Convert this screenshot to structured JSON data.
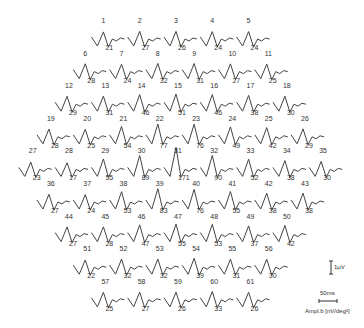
{
  "chart_data": {
    "type": "waveform-array",
    "title": "",
    "layout": "hexagonal",
    "rows": [
      {
        "hexagons": [
          {
            "id": "1",
            "amp": "21"
          },
          {
            "id": "2",
            "amp": "27"
          },
          {
            "id": "3",
            "amp": "26"
          },
          {
            "id": "4",
            "amp": "24"
          },
          {
            "id": "5",
            "amp": "24"
          }
        ]
      },
      {
        "hexagons": [
          {
            "id": "6",
            "amp": "28"
          },
          {
            "id": "7",
            "amp": "24"
          },
          {
            "id": "8",
            "amp": "32"
          },
          {
            "id": "9",
            "amp": "31"
          },
          {
            "id": "10",
            "amp": "27"
          },
          {
            "id": "11",
            "amp": "25"
          }
        ]
      },
      {
        "hexagons": [
          {
            "id": "12",
            "amp": "29"
          },
          {
            "id": "13",
            "amp": "31"
          },
          {
            "id": "14",
            "amp": "46"
          },
          {
            "id": "15",
            "amp": "51"
          },
          {
            "id": "16",
            "amp": "46"
          },
          {
            "id": "17",
            "amp": "38"
          },
          {
            "id": "18",
            "amp": "30"
          }
        ]
      },
      {
        "hexagons": [
          {
            "id": "19",
            "amp": "28"
          },
          {
            "id": "20",
            "amp": "25"
          },
          {
            "id": "21",
            "amp": "54"
          },
          {
            "id": "22",
            "amp": "77"
          },
          {
            "id": "23",
            "amp": "76"
          },
          {
            "id": "24",
            "amp": "49"
          },
          {
            "id": "25",
            "amp": "42"
          },
          {
            "id": "26",
            "amp": "29"
          }
        ]
      },
      {
        "hexagons": [
          {
            "id": "27",
            "amp": "23"
          },
          {
            "id": "28",
            "amp": "17"
          },
          {
            "id": "29",
            "amp": "55"
          },
          {
            "id": "30",
            "amp": "89"
          },
          {
            "id": "31",
            "amp": "171"
          },
          {
            "id": "32",
            "amp": "90"
          },
          {
            "id": "33",
            "amp": "52"
          },
          {
            "id": "34",
            "amp": "38"
          },
          {
            "id": "35",
            "amp": "30"
          }
        ]
      },
      {
        "hexagons": [
          {
            "id": "36",
            "amp": "27"
          },
          {
            "id": "37",
            "amp": "24"
          },
          {
            "id": "38",
            "amp": "53"
          },
          {
            "id": "39",
            "amp": "83"
          },
          {
            "id": "40",
            "amp": "76"
          },
          {
            "id": "41",
            "amp": "55"
          },
          {
            "id": "42",
            "amp": "38"
          },
          {
            "id": "43",
            "amp": "38"
          }
        ]
      },
      {
        "hexagons": [
          {
            "id": "44",
            "amp": "27"
          },
          {
            "id": "45",
            "amp": "28"
          },
          {
            "id": "46",
            "amp": "47"
          },
          {
            "id": "47",
            "amp": "55"
          },
          {
            "id": "48",
            "amp": "53"
          },
          {
            "id": "49",
            "amp": "37"
          },
          {
            "id": "50",
            "amp": "42"
          }
        ]
      },
      {
        "hexagons": [
          {
            "id": "51",
            "amp": "22"
          },
          {
            "id": "52",
            "amp": "32"
          },
          {
            "id": "53",
            "amp": "32"
          },
          {
            "id": "54",
            "amp": "39"
          },
          {
            "id": "55",
            "amp": "31"
          },
          {
            "id": "56",
            "amp": "30"
          }
        ]
      },
      {
        "hexagons": [
          {
            "id": "57",
            "amp": "25"
          },
          {
            "id": "58",
            "amp": "27"
          },
          {
            "id": "59",
            "amp": "26"
          },
          {
            "id": "60",
            "amp": "33"
          },
          {
            "id": "61",
            "amp": "26"
          }
        ]
      }
    ],
    "scale_bars": {
      "amplitude_label": "1µV",
      "time_label": "50ms",
      "units_label": "Ampl.b [nV/deg²]"
    }
  }
}
